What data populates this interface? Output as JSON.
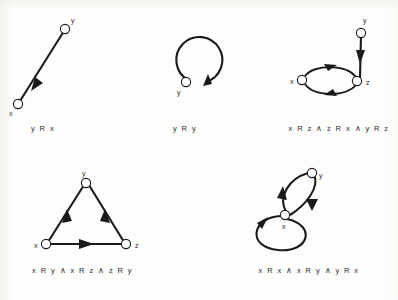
{
  "figure": {
    "background_color": "#fdfdfc",
    "ink_color": "#1a1a1a",
    "node_fill": "#ffffff",
    "node_count": 5
  },
  "panels": [
    {
      "id": "panel-1",
      "caption": "y R x",
      "nodes": [
        {
          "label": "x",
          "name": "node-x"
        },
        {
          "label": "y",
          "name": "node-y"
        }
      ],
      "edges": [
        {
          "from": "y",
          "to": "x",
          "kind": "straight",
          "name": "edge-y-to-x"
        }
      ]
    },
    {
      "id": "panel-2",
      "caption": "y R y",
      "nodes": [
        {
          "label": "y",
          "name": "node-y"
        }
      ],
      "edges": [
        {
          "from": "y",
          "to": "y",
          "kind": "self-loop",
          "name": "edge-y-to-y"
        }
      ]
    },
    {
      "id": "panel-3",
      "caption": "x R z ∧ z R x ∧ y R z",
      "nodes": [
        {
          "label": "x",
          "name": "node-x"
        },
        {
          "label": "y",
          "name": "node-y"
        },
        {
          "label": "z",
          "name": "node-z"
        }
      ],
      "edges": [
        {
          "from": "x",
          "to": "z",
          "kind": "curve",
          "name": "edge-x-to-z"
        },
        {
          "from": "z",
          "to": "x",
          "kind": "curve",
          "name": "edge-z-to-x"
        },
        {
          "from": "y",
          "to": "z",
          "kind": "straight",
          "name": "edge-y-to-z"
        }
      ]
    },
    {
      "id": "panel-4",
      "caption": "x R y ∧ x R z ∧ z R y",
      "nodes": [
        {
          "label": "x",
          "name": "node-x"
        },
        {
          "label": "y",
          "name": "node-y"
        },
        {
          "label": "z",
          "name": "node-z"
        }
      ],
      "edges": [
        {
          "from": "x",
          "to": "y",
          "kind": "straight",
          "name": "edge-x-to-y"
        },
        {
          "from": "x",
          "to": "z",
          "kind": "straight",
          "name": "edge-x-to-z"
        },
        {
          "from": "z",
          "to": "y",
          "kind": "straight",
          "name": "edge-z-to-y"
        }
      ]
    },
    {
      "id": "panel-5",
      "caption": "x R x ∧ x R y ∧ y R x",
      "nodes": [
        {
          "label": "x",
          "name": "node-x"
        },
        {
          "label": "y",
          "name": "node-y"
        }
      ],
      "edges": [
        {
          "from": "x",
          "to": "x",
          "kind": "self-loop",
          "name": "edge-x-to-x"
        },
        {
          "from": "x",
          "to": "y",
          "kind": "curve",
          "name": "edge-x-to-y"
        },
        {
          "from": "y",
          "to": "x",
          "kind": "curve",
          "name": "edge-y-to-x"
        }
      ]
    }
  ]
}
